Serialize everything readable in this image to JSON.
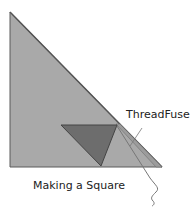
{
  "diagram": {
    "title": "Making a Square",
    "labels": {
      "thread": "ThreadFuse",
      "caption": "Making a Square"
    },
    "colors": {
      "large_triangle": "#a9a9a9",
      "small_triangle": "#6d6d6d",
      "edge": "#555555",
      "thread": "#777777"
    }
  }
}
